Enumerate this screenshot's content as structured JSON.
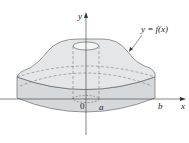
{
  "labels": {
    "y_axis": "y",
    "x_axis": "x",
    "origin": "0",
    "a": "a",
    "b": "b",
    "curve": "y = f(x)"
  },
  "colors": {
    "fill": "#e2e4e5",
    "fill_dark": "#cfd2d4",
    "stroke": "#444444"
  }
}
